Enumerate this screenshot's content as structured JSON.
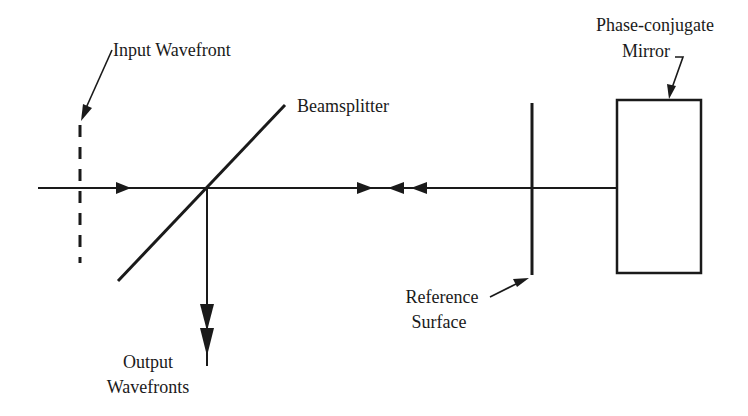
{
  "diagram": {
    "type": "optical-setup",
    "labels": {
      "input_wavefront": "Input Wavefront",
      "beamsplitter": "Beamsplitter",
      "phase_conjugate_line1": "Phase-conjugate",
      "phase_conjugate_line2": "Mirror",
      "reference_line1": "Reference",
      "reference_line2": "Surface",
      "output_line1": "Output",
      "output_line2": "Wavefronts"
    },
    "components": [
      {
        "id": "input-wavefront",
        "kind": "dashed-line"
      },
      {
        "id": "beamsplitter",
        "kind": "diagonal-line"
      },
      {
        "id": "reference-surface",
        "kind": "vertical-line"
      },
      {
        "id": "phase-conjugate-mirror",
        "kind": "rectangle"
      }
    ],
    "beam_arrows": {
      "incoming": "right",
      "between_bs_and_reference": [
        "right",
        "left",
        "left"
      ],
      "output": [
        "down",
        "down"
      ]
    },
    "colors": {
      "stroke": "#1a1a1a",
      "background": "#ffffff"
    }
  }
}
